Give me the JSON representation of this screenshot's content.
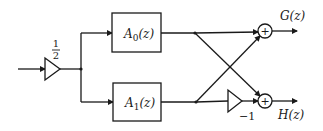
{
  "diagram": {
    "type": "block-diagram",
    "input_gain": {
      "numerator": "1",
      "denominator": "2"
    },
    "blocks": [
      {
        "id": "A0",
        "label_main": "A",
        "label_sub": "0",
        "label_arg": "(z)"
      },
      {
        "id": "A1",
        "label_main": "A",
        "label_sub": "1",
        "label_arg": "(z)"
      }
    ],
    "negation_gain": {
      "label": "−1"
    },
    "adders": [
      {
        "id": "top",
        "symbol": "+"
      },
      {
        "id": "bottom",
        "symbol": "+"
      }
    ],
    "outputs": [
      {
        "id": "G",
        "label": "G(z)"
      },
      {
        "id": "H",
        "label": "H(z)"
      }
    ],
    "colors": {
      "stroke": "#1a1a1a",
      "background": "#ffffff"
    }
  }
}
